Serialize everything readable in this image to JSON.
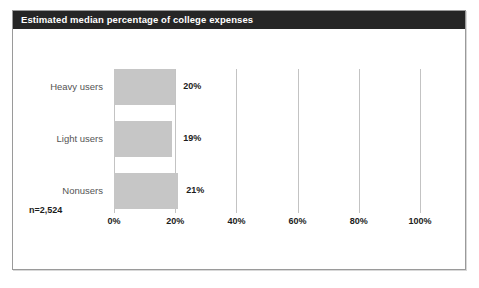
{
  "figure": {
    "title": "Estimated median percentage of college expenses",
    "sample_note": "n=2,524",
    "title_bar_color": "#262626",
    "bar_color": "#c6c6c6",
    "gridline_color": "#c3c3c3",
    "border_color": "#9a9a9a",
    "background_color": "#ffffff"
  },
  "chart_data": {
    "type": "bar",
    "orientation": "horizontal",
    "title": "Estimated median percentage of college expenses",
    "xlabel": "",
    "ylabel": "",
    "categories": [
      "Heavy users",
      "Light users",
      "Nonusers"
    ],
    "values": [
      20,
      19,
      21
    ],
    "value_labels": [
      "20%",
      "19%",
      "21%"
    ],
    "xlim": [
      0,
      100
    ],
    "xticks": [
      0,
      20,
      40,
      60,
      80,
      100
    ],
    "xtick_labels": [
      "0%",
      "20%",
      "40%",
      "60%",
      "80%",
      "100%"
    ],
    "grid": true,
    "grid_axis": "x",
    "legend": false,
    "annotations": [
      "n=2,524"
    ],
    "series": [
      {
        "name": "Estimated median percentage of college expenses",
        "values": [
          20,
          19,
          21
        ]
      }
    ]
  }
}
